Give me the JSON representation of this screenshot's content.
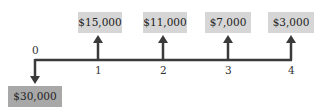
{
  "diagram": {
    "type": "cash-flow-timeline",
    "line_color": "#3a3a3a",
    "box_color_inflow": "#d6d6d6",
    "box_color_outflow": "#a8a8a8",
    "periods": [
      "0",
      "1",
      "2",
      "3",
      "4"
    ],
    "outflow": {
      "period": "0",
      "amount": "$30,000"
    },
    "inflows": [
      {
        "period": "1",
        "amount": "$15,000"
      },
      {
        "period": "2",
        "amount": "$11,000"
      },
      {
        "period": "3",
        "amount": "$7,000"
      },
      {
        "period": "4",
        "amount": "$3,000"
      }
    ]
  }
}
